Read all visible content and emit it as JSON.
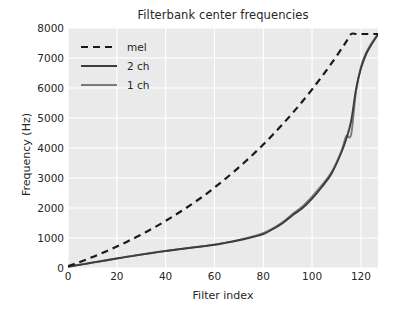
{
  "chart_data": {
    "type": "line",
    "title": "Filterbank center frequencies",
    "xlabel": "Filter index",
    "ylabel": "Frequency (Hz)",
    "xlim": [
      0,
      127
    ],
    "ylim": [
      0,
      8000
    ],
    "xticks": [
      0,
      20,
      40,
      60,
      80,
      100,
      120
    ],
    "yticks": [
      0,
      1000,
      2000,
      3000,
      4000,
      5000,
      6000,
      7000,
      8000
    ],
    "grid": true,
    "legend_position": "upper left",
    "x": [
      0,
      4,
      8,
      12,
      16,
      20,
      24,
      28,
      32,
      36,
      40,
      44,
      48,
      52,
      56,
      60,
      64,
      68,
      72,
      76,
      80,
      84,
      88,
      92,
      96,
      100,
      104,
      108,
      112,
      114,
      116,
      118,
      120,
      122,
      124,
      127
    ],
    "series": [
      {
        "name": "mel",
        "style": "dashed",
        "color": "#1a1a1a",
        "values": [
          60,
          175,
          300,
          430,
          570,
          715,
          870,
          1030,
          1200,
          1380,
          1570,
          1770,
          1980,
          2200,
          2430,
          2680,
          2940,
          3215,
          3500,
          3800,
          4115,
          4450,
          4800,
          5165,
          5550,
          5955,
          6380,
          6830,
          7300,
          7545,
          7800,
          7800,
          7800,
          7800,
          7800,
          7800
        ]
      },
      {
        "name": "2 ch",
        "style": "solid",
        "color": "#3d3d3d",
        "values": [
          40,
          95,
          150,
          205,
          260,
          315,
          370,
          420,
          470,
          520,
          565,
          610,
          650,
          690,
          730,
          775,
          830,
          890,
          960,
          1040,
          1130,
          1300,
          1500,
          1760,
          1990,
          2310,
          2700,
          3150,
          3850,
          4300,
          4900,
          5950,
          6650,
          7100,
          7400,
          7780
        ]
      },
      {
        "name": "1 ch",
        "style": "solid",
        "color": "#7a7a7a",
        "values": [
          45,
          100,
          155,
          210,
          265,
          320,
          375,
          425,
          475,
          525,
          570,
          612,
          655,
          695,
          735,
          780,
          835,
          895,
          975,
          1060,
          1160,
          1320,
          1530,
          1800,
          2050,
          2380,
          2760,
          3200,
          3900,
          4400,
          4450,
          5900,
          6700,
          7150,
          7450,
          7800
        ]
      }
    ]
  },
  "legend": {
    "items": [
      {
        "label": "mel"
      },
      {
        "label": "2 ch"
      },
      {
        "label": "1 ch"
      }
    ]
  },
  "style": {
    "plot_background": "#eaeaea",
    "grid_color": "#ffffff",
    "figure_background": "#ffffff",
    "text_color": "#262626"
  }
}
